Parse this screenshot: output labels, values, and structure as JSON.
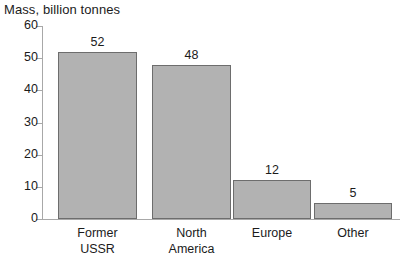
{
  "chart_data": {
    "type": "bar",
    "title": "Mass, billion tonnes",
    "xlabel": "",
    "ylabel": "",
    "categories": [
      "Former\nUSSR",
      "North\nAmerica",
      "Europe",
      "Other"
    ],
    "values": [
      52,
      48,
      12,
      5
    ],
    "value_labels": [
      "52",
      "48",
      "12",
      "5"
    ],
    "ylim": [
      0,
      60
    ],
    "yticks": [
      0,
      10,
      20,
      30,
      40,
      50,
      60
    ],
    "ytick_labels": [
      "0",
      "10",
      "20",
      "30",
      "40",
      "50",
      "60"
    ],
    "grid": false,
    "legend": false,
    "colors": {
      "bar_fill": "#b2b2b2",
      "bar_border": "#6d6d6d",
      "axis": "#a8a8a8",
      "text": "#1b1b1b",
      "background": "#ffffff"
    }
  }
}
